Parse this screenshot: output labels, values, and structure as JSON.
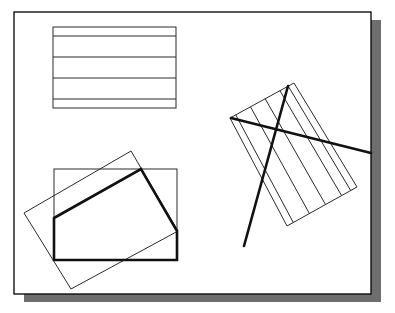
{
  "figure": {
    "caption_fragment": "",
    "frame": {
      "x": 14,
      "y": 12,
      "width": 357,
      "height": 282,
      "stroke": "#000000",
      "fill": "#ffffff"
    },
    "shadow": {
      "offset_x": 10,
      "offset_y": 8,
      "color": "#6e6e6e"
    },
    "colors": {
      "thin": "#2a2a2a",
      "thick": "#111111"
    }
  },
  "shapes": {
    "striped_rect": {
      "x": 53,
      "y": 27,
      "width": 123,
      "height": 81,
      "lines_y": [
        36,
        57,
        78,
        99
      ]
    },
    "rotated_striped_rect": {
      "corners": [
        [
          230,
          118
        ],
        [
          294,
          83
        ],
        [
          357,
          187
        ],
        [
          287,
          226
        ]
      ],
      "stripe_fractions": [
        0.09,
        0.32,
        0.55,
        0.78,
        0.91
      ]
    },
    "thick_lines": [
      {
        "x1": 231,
        "y1": 118,
        "x2": 371,
        "y2": 153
      },
      {
        "x1": 288,
        "y1": 86,
        "x2": 244,
        "y2": 246
      }
    ],
    "clip_box": {
      "x": 54,
      "y": 169,
      "width": 123,
      "height": 91
    },
    "rotated_rect": {
      "corners": [
        [
          131,
          151
        ],
        [
          178,
          231
        ],
        [
          71,
          289
        ],
        [
          24,
          213
        ]
      ]
    },
    "clipped_polygon": {
      "points": [
        [
          54,
          218
        ],
        [
          141,
          169
        ],
        [
          177,
          231
        ],
        [
          177,
          260
        ],
        [
          54,
          260
        ]
      ]
    }
  }
}
